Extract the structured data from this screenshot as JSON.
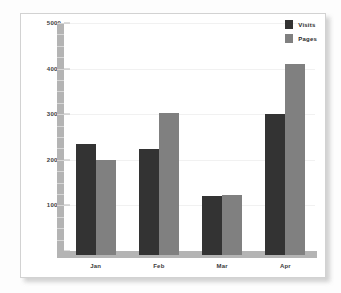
{
  "chart_data": {
    "type": "bar",
    "title": "",
    "subtitle": "",
    "xlabel": "",
    "ylabel": "",
    "categories": [
      "Jan",
      "Feb",
      "Mar",
      "Apr"
    ],
    "series": [
      {
        "name": "Visits",
        "color": "#333333",
        "values": [
          2350,
          2230,
          1200,
          3010
        ]
      },
      {
        "name": "Pages",
        "color": "#808080",
        "values": [
          1990,
          3030,
          1220,
          4100
        ]
      }
    ],
    "ylim": [
      0,
      5000
    ],
    "yticks": [
      0,
      1000,
      2000,
      3000,
      4000,
      5000
    ],
    "ytick_labels": [
      "0",
      "1000",
      "2000",
      "3000",
      "4000",
      "5000"
    ],
    "grid": true,
    "legend_position": "top-right",
    "orientation": "vertical",
    "grouped": true
  },
  "legend": {
    "items": [
      {
        "label": "Visits",
        "color": "#333333"
      },
      {
        "label": "Pages",
        "color": "#808080"
      }
    ]
  },
  "axes": {
    "y_labels": [
      "5000",
      "4000",
      "3000",
      "2000",
      "1000",
      "0"
    ],
    "x_labels": [
      "Jan",
      "Feb",
      "Mar",
      "Apr"
    ]
  },
  "colors": {
    "series_visits": "#333333",
    "series_pages": "#808080",
    "axis_band": "#b4b4b4",
    "gridline": "#f1f1f1",
    "panel_background": "#ffffff",
    "panel_border": "#d2d2d2",
    "page_background": "#fdfdfd"
  }
}
